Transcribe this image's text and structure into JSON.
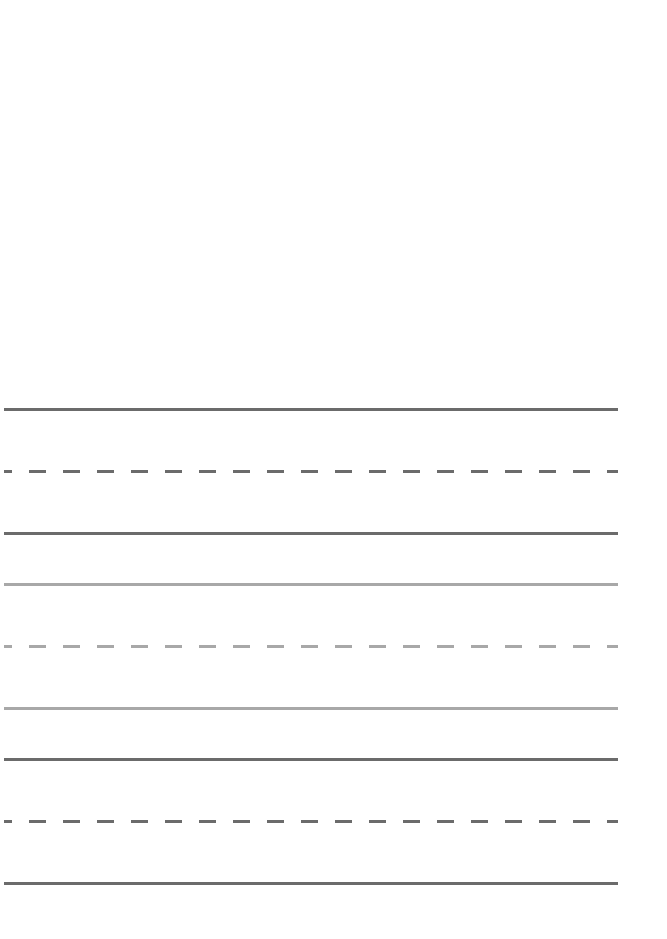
{
  "document": {
    "type": "handwriting-practice-sheet",
    "colors": {
      "dark": "#6b6b6b",
      "light": "#a8a8a8",
      "background": "#ffffff"
    },
    "line_sets": [
      {
        "tone": "dark",
        "lines": [
          {
            "style": "solid",
            "y": 408
          },
          {
            "style": "dashed",
            "y": 470
          },
          {
            "style": "solid",
            "y": 532
          }
        ]
      },
      {
        "tone": "light",
        "lines": [
          {
            "style": "solid",
            "y": 583
          },
          {
            "style": "dashed",
            "y": 645
          },
          {
            "style": "solid",
            "y": 707
          }
        ]
      },
      {
        "tone": "dark",
        "lines": [
          {
            "style": "solid",
            "y": 758
          },
          {
            "style": "dashed",
            "y": 820
          },
          {
            "style": "solid",
            "y": 882
          }
        ]
      }
    ],
    "dash": {
      "length": 17,
      "gap": 17,
      "first_stub": 8
    }
  }
}
